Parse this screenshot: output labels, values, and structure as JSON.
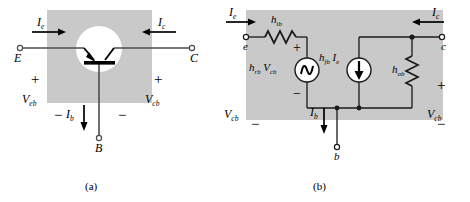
{
  "figure": {
    "background_color": "#ffffff",
    "shade_color": "#c9c9c9",
    "line_color": "#4d4d4d",
    "symbol_color": "#000000",
    "captions": [
      {
        "text": "(a)",
        "x": 85,
        "y": 183
      },
      {
        "text": "(b)",
        "x": 313,
        "y": 183
      }
    ]
  },
  "circuit_a": {
    "name": "common-base-transistor",
    "terminals": [
      {
        "id": "E",
        "label": "E",
        "x": 14,
        "y": 49
      },
      {
        "id": "C",
        "label": "C",
        "x": 197,
        "y": 49
      },
      {
        "id": "B",
        "label": "B",
        "x": 96,
        "y": 144
      }
    ],
    "currents": [
      {
        "label": "I",
        "sub": "e",
        "direction": "right",
        "x": 35,
        "y": 22
      },
      {
        "label": "I",
        "sub": "c",
        "direction": "left",
        "x": 163,
        "y": 22
      },
      {
        "label": "I",
        "sub": "b",
        "direction": "down",
        "x": 68,
        "y": 112
      }
    ],
    "voltages": [
      {
        "label": "V",
        "sub": "eb",
        "plus_x": 33,
        "plus_y": 80,
        "minus_x": 48,
        "minus_y": 113,
        "lbl_x": 22,
        "lbl_y": 100
      },
      {
        "label": "V",
        "sub": "cb",
        "plus_x": 155,
        "plus_y": 80,
        "minus_x": 118,
        "minus_y": 113,
        "lbl_x": 146,
        "lbl_y": 100
      }
    ],
    "device": "pnp-transistor-symbol"
  },
  "circuit_b": {
    "name": "common-base-h-parameter-model",
    "terminals": [
      {
        "id": "e",
        "label": "e",
        "x": 242,
        "y": 48
      },
      {
        "id": "c",
        "label": "c",
        "x": 445,
        "y": 48
      },
      {
        "id": "b",
        "label": "b",
        "x": 335,
        "y": 144
      }
    ],
    "currents": [
      {
        "label": "I",
        "sub": "e",
        "direction": "right",
        "x": 229,
        "y": 12
      },
      {
        "label": "I",
        "sub": "c",
        "direction": "left",
        "x": 437,
        "y": 12
      },
      {
        "label": "I",
        "sub": "b",
        "direction": "down",
        "x": 314,
        "y": 110
      }
    ],
    "components": [
      {
        "type": "resistor-horizontal",
        "label": "h",
        "sub": "ib",
        "lbl_x": 272,
        "lbl_y": 19
      },
      {
        "type": "voltage-source",
        "label_main": "h",
        "label_main_sub": "rb",
        "label_second": "V",
        "label_second_sub": "cb",
        "lbl_x": 249,
        "lbl_y": 63
      },
      {
        "type": "current-source",
        "label_main": "h",
        "label_main_sub": "fb",
        "label_second": "I",
        "label_second_sub": "e",
        "lbl_x": 320,
        "lbl_y": 53
      },
      {
        "type": "resistor-vertical",
        "label": "h",
        "sub": "ob",
        "lbl_x": 399,
        "lbl_y": 67
      }
    ],
    "polarity_marks": [
      {
        "sign": "+",
        "x": 291,
        "y": 44
      },
      {
        "sign": "−",
        "x": 291,
        "y": 91
      },
      {
        "sign": "+",
        "x": 439,
        "y": 83
      },
      {
        "sign": "−",
        "x": 439,
        "y": 120
      },
      {
        "sign": "−",
        "x": 253,
        "y": 120
      }
    ],
    "voltages": [
      {
        "label": "V",
        "sub": "cb",
        "lbl_x": 226,
        "lbl_y": 113
      },
      {
        "label": "V",
        "sub": "cb",
        "lbl_x": 428,
        "lbl_y": 113
      }
    ]
  }
}
